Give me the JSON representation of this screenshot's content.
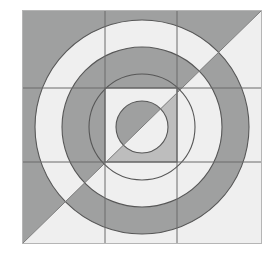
{
  "artwork": {
    "title": "Concentric Circles And Nested Squares On Diagonally Split Square",
    "type": "geometric-abstract",
    "canvas": {
      "width": 276,
      "height": 265,
      "background": "#ffffff"
    }
  },
  "palette": {
    "background": "#ffffff",
    "dark_gray": "#9fa0a0",
    "light_gray": "#efefef",
    "mid_gray": "#bdbdbd",
    "stroke": "#575757",
    "border": "#b5b5b5"
  },
  "geometry": {
    "outer_square": {
      "x": 22,
      "y": 10,
      "width": 240,
      "height": 234
    },
    "mid_square": {
      "x": 42,
      "y": 30,
      "width": 200,
      "height": 194
    },
    "inner_square": {
      "x": 105,
      "y": 88,
      "width": 72,
      "height": 74
    },
    "center": {
      "cx": 142,
      "cy": 127
    },
    "grid_lines": {
      "vertical_x": [
        105,
        177
      ],
      "horizontal_y": [
        88,
        162
      ]
    },
    "diagonal": {
      "description": "diagonal from bottom-left corner to top-right corner",
      "x1": 22,
      "y1": 244,
      "x2": 262,
      "y2": 10
    },
    "circles": [
      {
        "name": "circle-1-innermost",
        "r": 26
      },
      {
        "name": "circle-2",
        "r": 53
      },
      {
        "name": "circle-3",
        "r": 80
      },
      {
        "name": "circle-4-outermost",
        "r": 107
      }
    ]
  },
  "labels": {
    "figure_caption": ""
  }
}
